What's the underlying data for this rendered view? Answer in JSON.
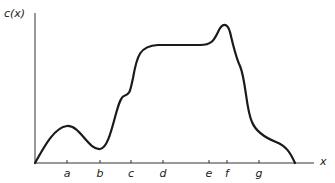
{
  "diagram": {
    "y_axis_label": "c(x)",
    "x_axis_label": "x",
    "ticks": [
      {
        "label": "a",
        "x": 67
      },
      {
        "label": "b",
        "x": 100
      },
      {
        "label": "c",
        "x": 131
      },
      {
        "label": "d",
        "x": 163
      },
      {
        "label": "e",
        "x": 209
      },
      {
        "label": "f",
        "x": 227
      },
      {
        "label": "g",
        "x": 259
      }
    ],
    "curve_color": "#1a1a1a",
    "axis_color": "#333333"
  }
}
